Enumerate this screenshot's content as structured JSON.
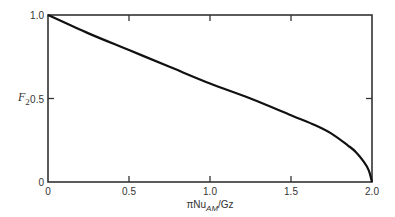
{
  "chart_data": {
    "type": "line",
    "title": "",
    "xlabel": "πNu_AM/Gz",
    "xlabel_parts": {
      "prefix": "πNu",
      "subscript": "AM",
      "suffix": "/Gz"
    },
    "ylabel": "F_2",
    "ylabel_parts": {
      "main": "F",
      "subscript": "2"
    },
    "xlim": [
      0,
      2.0
    ],
    "ylim": [
      0,
      1.0
    ],
    "grid": false,
    "legend": null,
    "x_ticks": [
      0,
      0.5,
      1.0,
      1.5,
      2.0
    ],
    "x_tick_labels": [
      "0",
      "0.5",
      "1.0",
      "1.5",
      "2.0"
    ],
    "y_ticks": [
      0,
      0.5,
      1.0
    ],
    "y_tick_labels": [
      "0",
      "0.5",
      "1.0"
    ],
    "series": [
      {
        "name": "F2",
        "x": [
          0,
          0.25,
          0.5,
          0.75,
          1.0,
          1.25,
          1.5,
          1.65,
          1.75,
          1.85,
          1.9,
          1.95,
          1.98,
          2.0
        ],
        "y": [
          1.0,
          0.89,
          0.79,
          0.69,
          0.59,
          0.5,
          0.4,
          0.34,
          0.29,
          0.22,
          0.18,
          0.12,
          0.07,
          0.0
        ]
      }
    ],
    "color": "#111111"
  }
}
